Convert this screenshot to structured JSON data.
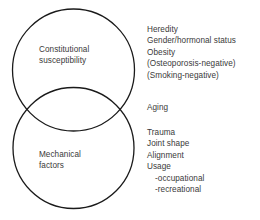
{
  "diagram": {
    "type": "venn-two-circle",
    "stroke_color": "#1a1a1a",
    "text_color": "#3a3a3a",
    "background_color": "#ffffff",
    "circles": [
      {
        "id": "constitutional",
        "label": "Constitutional\nsusceptibility",
        "label_line1": "Constitutional",
        "label_line2": "susceptibility"
      },
      {
        "id": "mechanical",
        "label": "Mechanical\nfactors",
        "label_line1": "Mechanical",
        "label_line2": "factors"
      }
    ]
  },
  "lists": {
    "constitutional_factors": [
      {
        "text": "Heredity",
        "indented": false
      },
      {
        "text": "Gender/hormonal status",
        "indented": false
      },
      {
        "text": "Obesity",
        "indented": false
      },
      {
        "text": "(Osteoporosis-negative)",
        "indented": false
      },
      {
        "text": "(Smoking-negative)",
        "indented": false
      }
    ],
    "shared_factors": [
      {
        "text": "Aging",
        "indented": false
      }
    ],
    "mechanical_factors": [
      {
        "text": "Trauma",
        "indented": false
      },
      {
        "text": "Joint shape",
        "indented": false
      },
      {
        "text": "Alignment",
        "indented": false
      },
      {
        "text": "Usage",
        "indented": false
      },
      {
        "text": "-occupational",
        "indented": true
      },
      {
        "text": "-recreational",
        "indented": true
      }
    ]
  }
}
